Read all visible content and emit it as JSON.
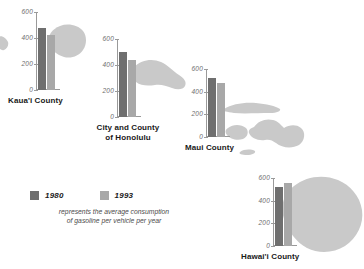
{
  "chart_data": {
    "type": "bar",
    "title": "",
    "xlabel": "",
    "ylabel": "",
    "ylim": [
      0,
      600
    ],
    "yticks": [
      600,
      400,
      200,
      0
    ],
    "grid": false,
    "legend_position": "bottom-left",
    "categories": [
      "Kaua'i County",
      "City and County of Honolulu",
      "Maui County",
      "Hawai'i County"
    ],
    "series": [
      {
        "name": "1980",
        "color": "#6f6f6f",
        "values": [
          480,
          500,
          520,
          520
        ]
      },
      {
        "name": "1993",
        "color": "#a8a8a8",
        "values": [
          420,
          440,
          480,
          560
        ]
      }
    ],
    "caption": "represents the average consumption of gasoline per vehicle per year"
  },
  "legend": {
    "items": [
      {
        "label": "1980",
        "swatch": "legend-swatch-1980"
      },
      {
        "label": "1993",
        "swatch": "legend-swatch-1993"
      }
    ],
    "caption_line1": "represents the average consumption",
    "caption_line2": "of gasoline per vehicle per year"
  },
  "panels": [
    {
      "id": "kauai",
      "label": "Kaua'i County",
      "label_line1": "Kaua'i County",
      "label_line2": "",
      "ticks": [
        "600",
        "400",
        "200",
        "0"
      ],
      "bar_1980": 480,
      "bar_1993": 420
    },
    {
      "id": "honolulu",
      "label": "City and County of Honolulu",
      "label_line1": "City and County",
      "label_line2": "of Honolulu",
      "ticks": [
        "600",
        "400",
        "200",
        "0"
      ],
      "bar_1980": 500,
      "bar_1993": 440
    },
    {
      "id": "maui",
      "label": "Maui County",
      "label_line1": "Maui County",
      "label_line2": "",
      "ticks": [
        "600",
        "400",
        "200",
        "0"
      ],
      "bar_1980": 520,
      "bar_1993": 480
    },
    {
      "id": "hawaii",
      "label": "Hawai'i County",
      "label_line1": "Hawai'i County",
      "label_line2": "",
      "ticks": [
        "600",
        "400",
        "200",
        "0"
      ],
      "bar_1980": 520,
      "bar_1993": 560
    }
  ],
  "colors": {
    "bar_1980": "#6f6f6f",
    "bar_1993": "#a8a8a8",
    "island": "#c9c9c9",
    "axis": "#9a9a9a",
    "tick_text": "#6e6e6e",
    "label_text": "#1a1a1a",
    "background": "#ffffff"
  }
}
